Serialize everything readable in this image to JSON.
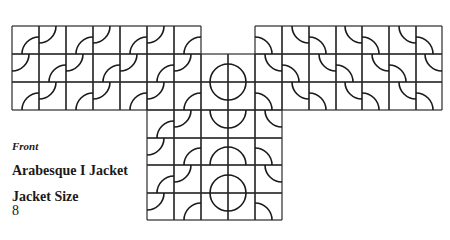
{
  "labels": {
    "view": "Front",
    "title": "Arabesque I Jacket",
    "size_heading": "Jacket Size",
    "size_value": "8"
  },
  "colors": {
    "line": "#2a2a2a",
    "arc": "#1a1a1a",
    "background": "#ffffff"
  },
  "grid": {
    "x_lines": [
      12,
      39,
      66,
      93,
      120,
      147,
      174,
      201,
      228,
      255,
      282,
      309,
      336,
      362,
      389,
      416,
      442
    ],
    "y_lines": [
      26,
      54,
      82,
      110,
      138,
      165,
      193,
      220
    ],
    "wings": {
      "top": 26,
      "bottom": 110,
      "left_cols": [
        0,
        7
      ],
      "right_cols": [
        9,
        16
      ]
    },
    "center": {
      "left": 201,
      "right": 255,
      "top": 54,
      "bottom": 220
    },
    "bottom_body": {
      "left": 147,
      "right": 282,
      "top": 110,
      "bottom": 220
    },
    "arc_radius": 17
  },
  "center_motifs": [
    {
      "type": "circle",
      "cx": 228,
      "cy": 82,
      "r": 18
    },
    {
      "type": "bowl",
      "cx": 228,
      "cy": 110,
      "r": 18
    },
    {
      "type": "dome",
      "cx": 228,
      "cy": 165,
      "r": 18
    },
    {
      "type": "circle",
      "cx": 228,
      "cy": 193,
      "r": 18
    }
  ]
}
